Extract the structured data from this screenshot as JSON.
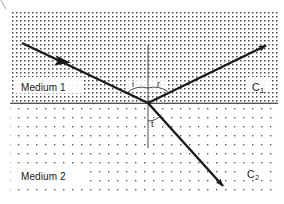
{
  "figure": {
    "width": 284,
    "height": 204,
    "background": "#ffffff",
    "ink_color": "#1a1a1a",
    "dot_color": "#555555"
  },
  "media": {
    "upper": {
      "name": "Medium 1",
      "speed_symbol": "C",
      "speed_subscript": "1",
      "shading": "dense-dot-grid",
      "dot_spacing_px": 4
    },
    "lower": {
      "name": "Medium 2",
      "speed_symbol": "C",
      "speed_subscript": "2",
      "shading": "sparse-dot-grid",
      "dot_spacing_px": 9
    }
  },
  "interface": {
    "label": "interface-line",
    "y": 103,
    "x_start": 10,
    "x_end": 278
  },
  "normal": {
    "label": "normal-line",
    "x": 148,
    "y_top": 45,
    "y_bottom": 148,
    "style": "thin-solid"
  },
  "incidence_point": {
    "x": 148,
    "y": 103
  },
  "rays": [
    {
      "id": "incident-ray",
      "name": "Incident ray",
      "from": {
        "x": 22,
        "y": 43
      },
      "to": {
        "x": 148,
        "y": 103
      },
      "arrow_position": "midpoint",
      "arrow_at": {
        "x": 62,
        "y": 62
      }
    },
    {
      "id": "reflected-ray",
      "name": "Reflected ray",
      "from": {
        "x": 148,
        "y": 103
      },
      "to": {
        "x": 272,
        "y": 42
      },
      "arrow_position": "end",
      "arrow_at": {
        "x": 272,
        "y": 42
      }
    },
    {
      "id": "refracted-ray",
      "name": "Refracted ray",
      "from": {
        "x": 148,
        "y": 103
      },
      "to": {
        "x": 228,
        "y": 192
      },
      "arrow_position": "end",
      "arrow_at": {
        "x": 228,
        "y": 192
      }
    }
  ],
  "angles": [
    {
      "id": "angle-of-incidence",
      "symbol": "i",
      "label_x": 132,
      "label_y": 86,
      "meaning": "angle of incidence"
    },
    {
      "id": "angle-of-reflection",
      "symbol": "r",
      "label_x": 156,
      "label_y": 86,
      "meaning": "angle of reflection"
    },
    {
      "id": "angle-of-refraction",
      "symbol": "t",
      "label_x": 152,
      "label_y": 126,
      "meaning": "angle of refraction (transmission)"
    }
  ],
  "labels": {
    "medium_1": {
      "text": "Medium 1",
      "x": 21,
      "y": 85
    },
    "medium_2": {
      "text": "Medium 2",
      "x": 21,
      "y": 175
    },
    "c1": {
      "text": "C",
      "sub": "1",
      "x": 252,
      "y": 85
    },
    "c2": {
      "text": "C",
      "sub": "2",
      "x": 246,
      "y": 172
    }
  }
}
